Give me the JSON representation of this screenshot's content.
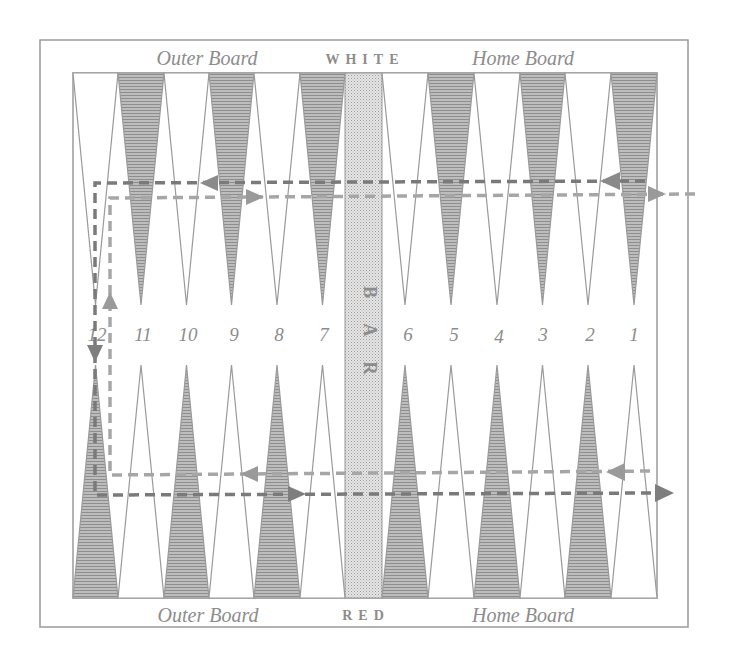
{
  "diagram": {
    "top_labels": {
      "left": "Outer Board",
      "center": "WHITE",
      "right": "Home Board"
    },
    "bottom_labels": {
      "left": "Outer Board",
      "center": "RED",
      "right": "Home Board"
    },
    "bar_label": "BAR",
    "point_numbers": [
      "12",
      "11",
      "10",
      "9",
      "8",
      "7",
      "6",
      "5",
      "4",
      "3",
      "2",
      "1"
    ],
    "colors": {
      "frame": "#9a9a9a",
      "dark_point": "#a8a8a8",
      "light_point": "#ffffff",
      "bar": "#d8d8d8",
      "arrow_dark": "#7a7a7a",
      "arrow_light": "#a0a0a0",
      "text": "#8c8c8c"
    },
    "paths": [
      {
        "name": "white-path-top-outer",
        "description": "dark dashed line from point 1 leftward across top to point 12, down left edge, then rightward across bottom exiting right"
      },
      {
        "name": "red-path-inner",
        "description": "light dashed line entering top right, moving left across top, down inner left, rightward-then-left along bottom to point 1 side"
      }
    ]
  }
}
